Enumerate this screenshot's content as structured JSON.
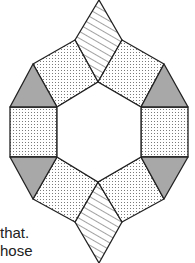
{
  "figure": {
    "colors": {
      "stroke": "#222222",
      "triangle_fill": "#a8a8a8",
      "square_fill": "#ffffff",
      "dot_color": "#777777",
      "hatch_color": "#444444"
    },
    "tiles": {
      "squares": 6,
      "triangles": 4,
      "rhombi": 2
    }
  },
  "text_fragments": [
    {
      "text": "that.",
      "x": 0,
      "y": 232
    },
    {
      "text": "hose",
      "x": 0,
      "y": 250
    }
  ]
}
